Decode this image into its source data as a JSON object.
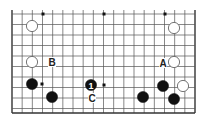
{
  "diagram": {
    "type": "go-board-diagram",
    "grid": {
      "columns": 19,
      "left_x": 12,
      "right_x": 195,
      "top_y": 14,
      "bottom_y": 113,
      "row_ys": [
        14,
        24.5,
        35,
        45.5,
        56,
        66.5,
        77,
        87.5,
        98,
        108.5,
        113
      ],
      "edges": [
        "left",
        "right",
        "bottom"
      ],
      "line_color": "#555555",
      "edge_color": "#333333"
    },
    "star_points": [
      {
        "x": 43,
        "y": 14
      },
      {
        "x": 104,
        "y": 14
      },
      {
        "x": 165,
        "y": 14
      },
      {
        "x": 42,
        "y": 84
      },
      {
        "x": 104,
        "y": 85
      },
      {
        "x": 165,
        "y": 84
      }
    ],
    "stones": [
      {
        "color": "white",
        "x": 32,
        "y": 26
      },
      {
        "color": "white",
        "x": 174,
        "y": 28
      },
      {
        "color": "white",
        "x": 32,
        "y": 62
      },
      {
        "color": "white",
        "x": 174,
        "y": 62
      },
      {
        "color": "black",
        "x": 32,
        "y": 84
      },
      {
        "color": "black",
        "x": 52,
        "y": 97
      },
      {
        "color": "black",
        "x": 91,
        "y": 85,
        "label": "1"
      },
      {
        "color": "black",
        "x": 143,
        "y": 97
      },
      {
        "color": "black",
        "x": 163,
        "y": 86
      },
      {
        "color": "white",
        "x": 183,
        "y": 86
      },
      {
        "color": "black",
        "x": 174,
        "y": 99
      }
    ],
    "labels": [
      {
        "text": "A",
        "x": 163,
        "y": 63
      },
      {
        "text": "B",
        "x": 52,
        "y": 62
      },
      {
        "text": "C",
        "x": 92,
        "y": 98
      }
    ]
  }
}
